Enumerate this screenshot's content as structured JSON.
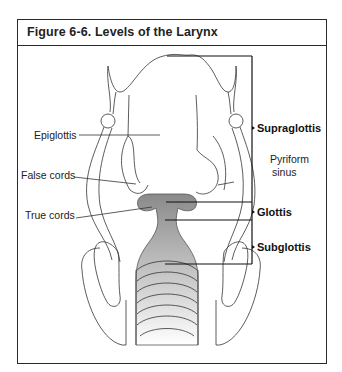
{
  "figure": {
    "title": "Figure 6-6. Levels of the Larynx"
  },
  "labels": {
    "left": {
      "epiglottis": "Epiglottis",
      "false_cords": "False cords",
      "true_cords": "True cords"
    },
    "right": {
      "supraglottis": "Supraglottis",
      "pyriform_line1": "Pyriform",
      "pyriform_line2": "sinus",
      "glottis": "Glottis",
      "subglottis": "Subglottis"
    }
  },
  "colors": {
    "line": "#333333",
    "bracket": "#111111",
    "glottis_fill": "#8a8a8a",
    "border": "#2a2a2a"
  }
}
